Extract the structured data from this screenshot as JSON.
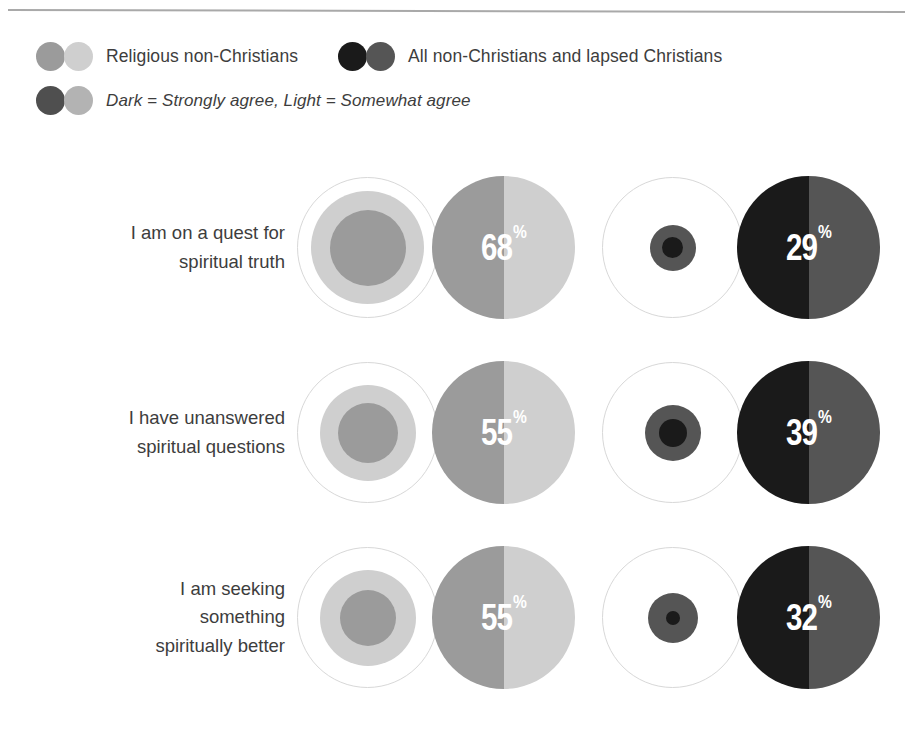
{
  "legend": {
    "rows": [
      {
        "entries": [
          {
            "id": "religious-non-christians",
            "label": "Religious non-Christians",
            "italic": false,
            "swatches": [
              "#9b9b9b",
              "#cfcfcf"
            ]
          },
          {
            "id": "all-non-christians-lapsed",
            "label": "All non-Christians and lapsed Christians",
            "italic": false,
            "swatches": [
              "#1a1a1a",
              "#555555"
            ]
          }
        ]
      },
      {
        "entries": [
          {
            "id": "shade-key",
            "label": "Dark = Strongly agree, Light = Somewhat agree",
            "italic": true,
            "swatches": [
              "#4f4f4f",
              "#b3b3b3"
            ]
          }
        ]
      }
    ]
  },
  "chart_data": {
    "type": "bubble",
    "title": "",
    "subtitle": "",
    "xlabel": "",
    "ylabel": "",
    "grid": false,
    "legend_position": "top",
    "note": "Each statement shows two audience groups. Within each group the outlined circle is the 100% reference, the light inner ring is 'somewhat agree' and the dark core is 'strongly agree'; the adjacent split circle is labelled with the total agree percentage (dark left half = strongly agree, light right half = somewhat agree).",
    "categories": [
      "I am on a quest for spiritual truth",
      "I have unanswered spiritual questions",
      "I am seeking something spiritually better"
    ],
    "series": [
      {
        "name": "Religious non-Christians",
        "dark_color": "#9b9b9b",
        "light_color": "#cfcfcf",
        "outline_color": "#d8d8d8",
        "values": [
          68,
          55,
          55
        ],
        "value_labels": [
          "68%",
          "55%",
          "55%"
        ]
      },
      {
        "name": "All non-Christians and lapsed Christians",
        "dark_color": "#1a1a1a",
        "light_color": "#555555",
        "outline_color": "#d8d8d8",
        "values": [
          29,
          39,
          32
        ],
        "value_labels": [
          "29%",
          "39%",
          "32%"
        ]
      }
    ]
  },
  "rows": [
    {
      "label_lines": [
        "I am on a quest for",
        "spiritual truth"
      ],
      "groups": [
        {
          "series": "Religious non-Christians",
          "value_label": "68%",
          "bubble": {
            "outer_d": 141,
            "mid_d": 113,
            "core_d": 76,
            "mid_color": "#cfcfcf",
            "core_color": "#9b9b9b",
            "outline_color": "#d8d8d8"
          },
          "dial": {
            "left_color": "#9b9b9b",
            "right_color": "#cfcfcf"
          }
        },
        {
          "series": "All non-Christians and lapsed Christians",
          "value_label": "29%",
          "bubble": {
            "outer_d": 141,
            "mid_d": 46,
            "core_d": 21,
            "mid_color": "#555555",
            "core_color": "#1a1a1a",
            "outline_color": "#d8d8d8"
          },
          "dial": {
            "left_color": "#1a1a1a",
            "right_color": "#555555"
          }
        }
      ]
    },
    {
      "label_lines": [
        "I have unanswered",
        "spiritual questions"
      ],
      "groups": [
        {
          "series": "Religious non-Christians",
          "value_label": "55%",
          "bubble": {
            "outer_d": 141,
            "mid_d": 96,
            "core_d": 60,
            "mid_color": "#cfcfcf",
            "core_color": "#9b9b9b",
            "outline_color": "#d8d8d8"
          },
          "dial": {
            "left_color": "#9b9b9b",
            "right_color": "#cfcfcf"
          }
        },
        {
          "series": "All non-Christians and lapsed Christians",
          "value_label": "39%",
          "bubble": {
            "outer_d": 141,
            "mid_d": 56,
            "core_d": 28,
            "mid_color": "#555555",
            "core_color": "#1a1a1a",
            "outline_color": "#d8d8d8"
          },
          "dial": {
            "left_color": "#1a1a1a",
            "right_color": "#555555"
          }
        }
      ]
    },
    {
      "label_lines": [
        "I am seeking",
        "something",
        "spiritually better"
      ],
      "groups": [
        {
          "series": "Religious non-Christians",
          "value_label": "55%",
          "bubble": {
            "outer_d": 141,
            "mid_d": 96,
            "core_d": 56,
            "mid_color": "#cfcfcf",
            "core_color": "#9b9b9b",
            "outline_color": "#d8d8d8"
          },
          "dial": {
            "left_color": "#9b9b9b",
            "right_color": "#cfcfcf"
          }
        },
        {
          "series": "All non-Christians and lapsed Christians",
          "value_label": "32%",
          "bubble": {
            "outer_d": 141,
            "mid_d": 50,
            "core_d": 14,
            "mid_color": "#555555",
            "core_color": "#1a1a1a",
            "outline_color": "#d8d8d8"
          },
          "dial": {
            "left_color": "#1a1a1a",
            "right_color": "#555555"
          }
        }
      ]
    }
  ]
}
